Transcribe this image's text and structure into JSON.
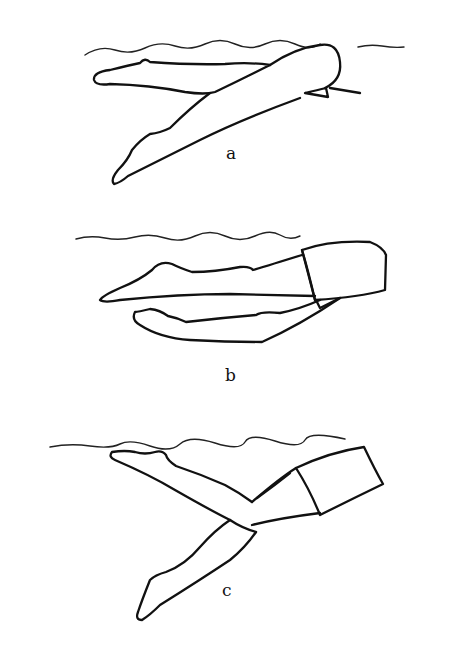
{
  "figure": {
    "panels": [
      {
        "id": "a",
        "label": "a"
      },
      {
        "id": "b",
        "label": "b"
      },
      {
        "id": "c",
        "label": "c"
      }
    ],
    "colors": {
      "background": "#ffffff",
      "ink": "#111111"
    }
  }
}
